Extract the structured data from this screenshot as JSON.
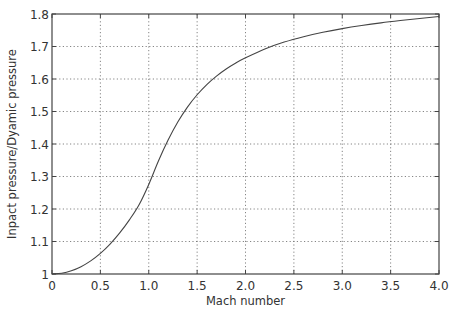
{
  "chart_data": {
    "type": "line",
    "title": "",
    "xlabel": "Mach number",
    "ylabel": "Inpact pressure/Dyamic pressure",
    "xlim": [
      0,
      4.0
    ],
    "ylim": [
      1.0,
      1.8
    ],
    "grid": true,
    "legend": null,
    "x_ticks": [
      "0",
      "0.5",
      "1.0",
      "1.5",
      "2.0",
      "2.5",
      "3.0",
      "3.5",
      "4.0"
    ],
    "x_tick_values": [
      0,
      0.5,
      1.0,
      1.5,
      2.0,
      2.5,
      3.0,
      3.5,
      4.0
    ],
    "y_ticks": [
      "1",
      "1.1",
      "1.2",
      "1.3",
      "1.4",
      "1.5",
      "1.6",
      "1.7",
      "1.8"
    ],
    "y_tick_values": [
      1.0,
      1.1,
      1.2,
      1.3,
      1.4,
      1.5,
      1.6,
      1.7,
      1.8
    ],
    "series": [
      {
        "name": "Impact pressure / Dynamic pressure",
        "color": "#444444",
        "x": [
          0,
          0.1,
          0.2,
          0.3,
          0.4,
          0.5,
          0.6,
          0.7,
          0.8,
          0.9,
          1.0,
          1.1,
          1.2,
          1.3,
          1.4,
          1.5,
          1.6,
          1.7,
          1.8,
          1.9,
          2.0,
          2.2,
          2.4,
          2.6,
          2.8,
          3.0,
          3.2,
          3.4,
          3.6,
          3.8,
          4.0
        ],
        "y": [
          1.0,
          1.0025,
          1.01,
          1.0226,
          1.0404,
          1.0636,
          1.0922,
          1.1265,
          1.1666,
          1.213,
          1.2756,
          1.3477,
          1.4121,
          1.4676,
          1.5136,
          1.5515,
          1.5829,
          1.609,
          1.6309,
          1.6494,
          1.6652,
          1.6902,
          1.709,
          1.7232,
          1.7344,
          1.7432,
          1.7503,
          1.7562,
          1.761,
          1.7651,
          1.7686
        ]
      }
    ]
  }
}
